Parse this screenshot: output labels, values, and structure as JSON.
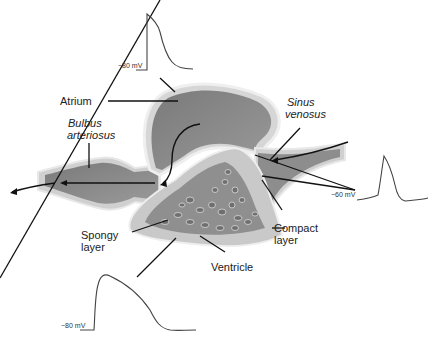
{
  "diagram": {
    "labels": {
      "atrium": "Atrium",
      "bulbus_line1": "Bulbus",
      "bulbus_line2": "arteriosus",
      "sinus_line1": "Sinus",
      "sinus_line2": "venosus",
      "spongy_line1": "Spongy",
      "spongy_line2": "layer",
      "compact_line1": "Compact",
      "compact_line2": "layer",
      "ventricle": "Ventricle"
    },
    "action_potentials": [
      {
        "region": "atrium",
        "resting_label": "−80 mV"
      },
      {
        "region": "sinus venosus",
        "resting_label": "−60 mV"
      },
      {
        "region": "ventricle",
        "resting_label": "−80 mV"
      }
    ],
    "colors": {
      "chamber_fill": "#8c8c8c",
      "wall_fill": "#c8c8c8",
      "outline": "#eeeeee",
      "trace": "#444444",
      "leader": "#111111"
    }
  }
}
